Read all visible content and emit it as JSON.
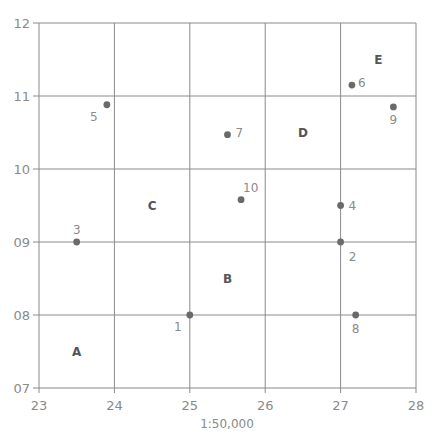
{
  "chart_data": {
    "type": "scatter",
    "title": "",
    "xlabel": "1:50,000",
    "ylabel": "",
    "xlim": [
      23,
      28
    ],
    "ylim": [
      7,
      12
    ],
    "grid": true,
    "x_ticks": [
      "23",
      "24",
      "25",
      "26",
      "27",
      "28"
    ],
    "y_ticks": [
      "07",
      "08",
      "09",
      "10",
      "11",
      "12"
    ],
    "points": [
      {
        "label": "1",
        "x": 25.0,
        "y": 8.0
      },
      {
        "label": "2",
        "x": 27.0,
        "y": 9.0
      },
      {
        "label": "3",
        "x": 23.5,
        "y": 9.0
      },
      {
        "label": "4",
        "x": 27.0,
        "y": 9.5
      },
      {
        "label": "5",
        "x": 23.9,
        "y": 10.88
      },
      {
        "label": "6",
        "x": 27.15,
        "y": 11.15
      },
      {
        "label": "7",
        "x": 25.5,
        "y": 10.47
      },
      {
        "label": "8",
        "x": 27.2,
        "y": 8.0
      },
      {
        "label": "9",
        "x": 27.7,
        "y": 10.85
      },
      {
        "label": "10",
        "x": 25.68,
        "y": 9.58
      }
    ],
    "zones": [
      {
        "label": "A",
        "x": 23.5,
        "y": 7.5
      },
      {
        "label": "B",
        "x": 25.5,
        "y": 8.5
      },
      {
        "label": "C",
        "x": 24.5,
        "y": 9.5
      },
      {
        "label": "D",
        "x": 26.5,
        "y": 10.5
      },
      {
        "label": "E",
        "x": 27.5,
        "y": 11.5
      }
    ]
  },
  "scale_label": "1:50,000"
}
